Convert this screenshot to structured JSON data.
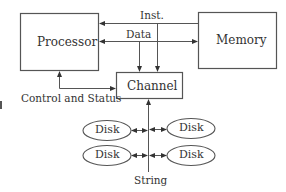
{
  "diagram": {
    "type": "block-diagram",
    "title": "",
    "colors": {
      "stroke": "#555555",
      "text": "#333333",
      "background": "#ffffff"
    },
    "nodes": {
      "processor": {
        "label": "Processor"
      },
      "memory": {
        "label": "Memory"
      },
      "channel": {
        "label": "Channel"
      },
      "disk_top_left": {
        "label": "Disk"
      },
      "disk_top_right": {
        "label": "Disk"
      },
      "disk_bottom_left": {
        "label": "Disk"
      },
      "disk_bottom_right": {
        "label": "Disk"
      }
    },
    "edges": {
      "inst": {
        "label": "Inst.",
        "from": "Memory",
        "to": "Processor / Channel"
      },
      "data": {
        "label": "Data",
        "from": "Processor",
        "to": "Memory / Channel",
        "bidirectional": true
      },
      "control": {
        "label": "Control and Status",
        "from": "Processor",
        "to": "Channel",
        "bidirectional": true
      },
      "string": {
        "label": "String",
        "from": "Disks",
        "to": "Channel"
      }
    }
  }
}
